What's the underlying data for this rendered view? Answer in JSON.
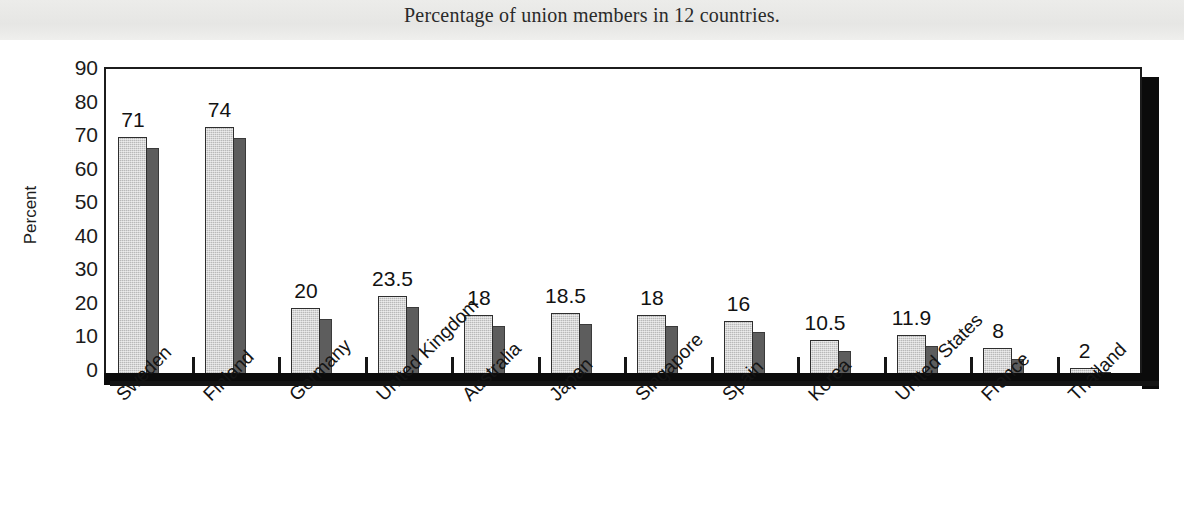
{
  "chart_data": {
    "type": "bar",
    "title": "Percentage of union members in 12 countries.",
    "xlabel": "",
    "ylabel": "Percent",
    "ylim": [
      0,
      90
    ],
    "ytick_step": 10,
    "yticks": [
      "90",
      "80",
      "70",
      "60",
      "50",
      "40",
      "30",
      "20",
      "10",
      "0"
    ],
    "grid": false,
    "legend": "none",
    "style": "3d-bar",
    "categories": [
      "Sweden",
      "Finland",
      "Germany",
      "United Kingdom",
      "Australia",
      "Japan",
      "Singapore",
      "Spain",
      "Korea",
      "United States",
      "France",
      "Thailand"
    ],
    "values": [
      71,
      74,
      20,
      23.5,
      18,
      18.5,
      18,
      16,
      10.5,
      11.9,
      8,
      2
    ],
    "value_labels": [
      "71",
      "74",
      "20",
      "23.5",
      "18",
      "18.5",
      "18",
      "16",
      "10.5",
      "11.9",
      "8",
      "2"
    ]
  },
  "colors": {
    "bar_front": "#b9b9b9",
    "bar_side": "#5d5d5d",
    "axis": "#1c1c1c",
    "floor": "#0b0b0b",
    "header_band": "#e9e9e7",
    "text": "#141414",
    "background": "#ffffff"
  }
}
